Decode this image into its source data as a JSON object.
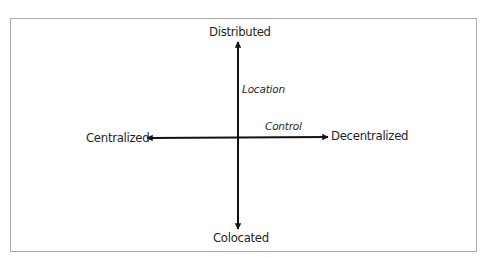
{
  "diagram": {
    "type": "two-axis quadrant diagram",
    "vertical_axis": {
      "name": "Location",
      "top_end": "Distributed",
      "bottom_end": "Colocated"
    },
    "horizontal_axis": {
      "name": "Control",
      "left_end": "Centralized",
      "right_end": "Decentralized"
    },
    "colors": {
      "line": "#111111",
      "text": "#1f1f1f",
      "frame": "#a9a9a9"
    }
  }
}
